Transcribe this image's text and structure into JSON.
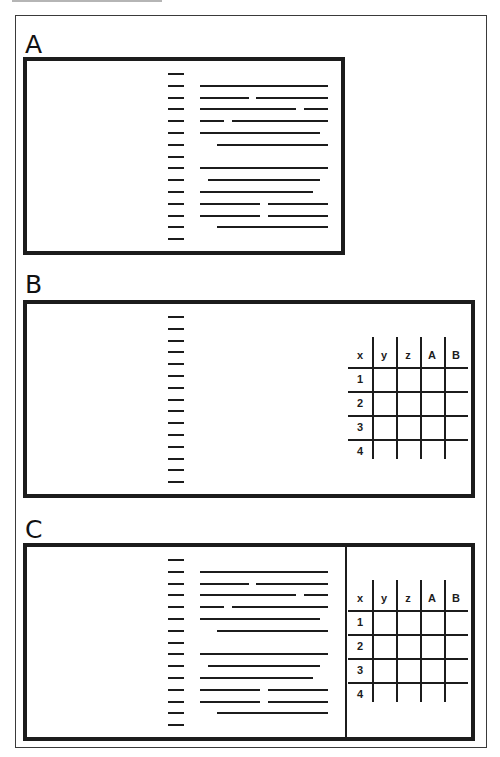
{
  "figure": {
    "header_clipped_text": ""
  },
  "panels": [
    {
      "id": "A",
      "label": "A",
      "content": [
        "index-column",
        "text-block"
      ],
      "index_dash_count": 15,
      "text_rows": [
        {
          "segments": []
        },
        {
          "segments": [
            [
              0,
              1.0
            ]
          ]
        },
        {
          "segments": [
            [
              0,
              0.38
            ],
            [
              0.44,
              1.0
            ]
          ]
        },
        {
          "segments": [
            [
              0,
              0.75
            ],
            [
              0.81,
              1.0
            ]
          ]
        },
        {
          "segments": [
            [
              0,
              0.19
            ],
            [
              0.25,
              1.0
            ]
          ]
        },
        {
          "segments": [
            [
              0,
              0.94
            ]
          ]
        },
        {
          "segments": [
            [
              0.13,
              1.0
            ]
          ]
        },
        {
          "segments": []
        },
        {
          "segments": [
            [
              0,
              1.0
            ]
          ]
        },
        {
          "segments": [
            [
              0.06,
              0.94
            ]
          ]
        },
        {
          "segments": [
            [
              0,
              0.88
            ]
          ]
        },
        {
          "segments": [
            [
              0,
              0.47
            ],
            [
              0.53,
              1.0
            ]
          ]
        },
        {
          "segments": [
            [
              0,
              0.47
            ],
            [
              0.53,
              1.0
            ]
          ]
        },
        {
          "segments": [
            [
              0.13,
              1.0
            ]
          ]
        },
        {
          "segments": []
        }
      ]
    },
    {
      "id": "B",
      "label": "B",
      "content": [
        "index-column",
        "table"
      ],
      "index_dash_count": 15
    },
    {
      "id": "C",
      "label": "C",
      "content": [
        "index-column",
        "text-block",
        "divider",
        "table"
      ],
      "index_dash_count": 15
    }
  ],
  "table": {
    "header": [
      "x",
      "y",
      "z",
      "A",
      "B"
    ],
    "rows": [
      "1",
      "2",
      "3",
      "4"
    ]
  }
}
